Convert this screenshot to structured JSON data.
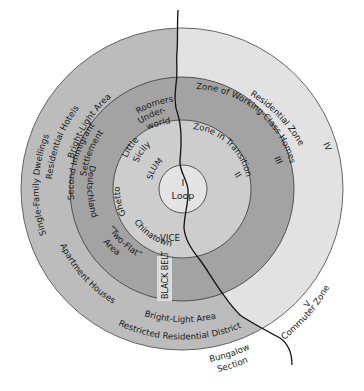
{
  "diagram": {
    "type": "concentric-zone-model",
    "colors": {
      "background": "#ffffff",
      "loop": "#e4e4e4",
      "zone2": "#cdcdcd",
      "zone3": "#a3a3a3",
      "zone4_west": "#bcbcbc",
      "zone4_east": "#e2e2e2",
      "black_belt": "#dcdcdc",
      "ring_stroke": "#555555",
      "river": "#111111"
    },
    "zones": {
      "loop": {
        "numeral": "I",
        "name": "Loop"
      },
      "zone2": {
        "numeral": "II",
        "name": "Zone in Transition"
      },
      "zone3": {
        "numeral": "III",
        "name": "Zone of Working-Class Homes"
      },
      "zone4": {
        "numeral": "IV",
        "name": "Residential Zone"
      },
      "zone5": {
        "numeral": "V",
        "name": "Commuter Zone"
      }
    },
    "labels": {
      "single_family": "Single-Family Dwellings",
      "residential_hotels": "Residential Hotels",
      "bright_light_top": "Bright-Light Area",
      "second_immigrant": "Second Immigrant",
      "settlement": "Settlement",
      "roomers": "Roomers",
      "under": "Under-",
      "world": "world",
      "little": "Little",
      "sicily": "Sicily",
      "ghetto": "Ghetto",
      "slum": "SLUM",
      "deutschland": "Deutschland",
      "chinatown": "Chinatown",
      "vice": "VICE",
      "two_flat": "“Two-Flat”",
      "area": "Area",
      "black_belt": "BLACK BELT",
      "apartment_houses": "Apartment Houses",
      "bright_light_bottom": "Bright-Light Area",
      "restricted": "Restricted Residential District",
      "bungalow": "Bungalow",
      "section": "Section"
    }
  }
}
